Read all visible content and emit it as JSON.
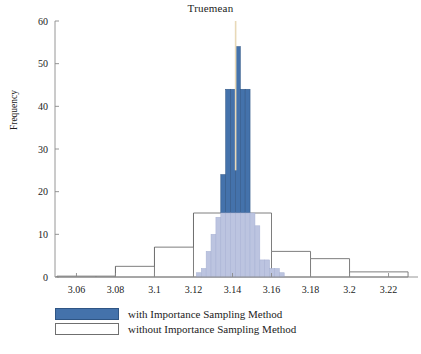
{
  "chart_data": {
    "type": "bar",
    "title": "Truemean",
    "xlabel": "",
    "ylabel": "Frequency",
    "xlim": [
      3.049,
      3.231
    ],
    "ylim": [
      0,
      60
    ],
    "grid": false,
    "legend_position": "bottom-left",
    "x_ticks": [
      "3.06",
      "3.08",
      "3.1",
      "3.12",
      "3.14",
      "3.16",
      "3.18",
      "3.2",
      "3.22"
    ],
    "x_tick_values": [
      3.06,
      3.08,
      3.1,
      3.12,
      3.14,
      3.16,
      3.18,
      3.2,
      3.22
    ],
    "y_ticks": [
      "0",
      "10",
      "20",
      "30",
      "40",
      "50",
      "60"
    ],
    "y_tick_values": [
      0,
      10,
      20,
      30,
      40,
      50,
      60
    ],
    "annotations": [
      {
        "name": "true-mean-marker",
        "type": "vline",
        "x": 3.1416,
        "color": "#e8d9b8",
        "y_from": 25,
        "y_to": 60
      }
    ],
    "series": [
      {
        "name": "with Importance Sampling Method",
        "style": "filled",
        "color": "#4472ab",
        "edge_color": "#2f5584",
        "bin_width": 0.0025,
        "bins": [
          {
            "x0": 3.1215,
            "x1": 3.124,
            "value": 1
          },
          {
            "x0": 3.124,
            "x1": 3.1265,
            "value": 2
          },
          {
            "x0": 3.1265,
            "x1": 3.129,
            "value": 6
          },
          {
            "x0": 3.129,
            "x1": 3.1315,
            "value": 10
          },
          {
            "x0": 3.1315,
            "x1": 3.134,
            "value": 14
          },
          {
            "x0": 3.134,
            "x1": 3.1365,
            "value": 24
          },
          {
            "x0": 3.1365,
            "x1": 3.139,
            "value": 44
          },
          {
            "x0": 3.139,
            "x1": 3.1415,
            "value": 44
          },
          {
            "x0": 3.1415,
            "x1": 3.144,
            "value": 54
          },
          {
            "x0": 3.144,
            "x1": 3.1465,
            "value": 44
          },
          {
            "x0": 3.1465,
            "x1": 3.149,
            "value": 44
          },
          {
            "x0": 3.149,
            "x1": 3.1515,
            "value": 15
          },
          {
            "x0": 3.1515,
            "x1": 3.154,
            "value": 12
          },
          {
            "x0": 3.154,
            "x1": 3.1565,
            "value": 4
          },
          {
            "x0": 3.1565,
            "x1": 3.159,
            "value": 4
          },
          {
            "x0": 3.159,
            "x1": 3.1615,
            "value": 2
          },
          {
            "x0": 3.1615,
            "x1": 3.164,
            "value": 2
          },
          {
            "x0": 3.164,
            "x1": 3.1665,
            "value": 1
          }
        ]
      },
      {
        "name": "without Importance Sampling Method",
        "style": "hollow",
        "color": "#ffffff",
        "edge_color": "#6f6f6f",
        "bin_width": 0.02,
        "bins": [
          {
            "x0": 3.05,
            "x1": 3.07,
            "value": 0.2
          },
          {
            "x0": 3.07,
            "x1": 3.08,
            "value": 0.2
          },
          {
            "x0": 3.08,
            "x1": 3.1,
            "value": 2.5
          },
          {
            "x0": 3.1,
            "x1": 3.12,
            "value": 7.0
          },
          {
            "x0": 3.12,
            "x1": 3.14,
            "value": 15.0
          },
          {
            "x0": 3.14,
            "x1": 3.16,
            "value": 15.0
          },
          {
            "x0": 3.16,
            "x1": 3.18,
            "value": 6.0
          },
          {
            "x0": 3.18,
            "x1": 3.2,
            "value": 4.3
          },
          {
            "x0": 3.2,
            "x1": 3.23,
            "value": 1.2
          }
        ]
      }
    ]
  },
  "legend": {
    "items": [
      {
        "label": "with Importance Sampling Method",
        "style": "filled"
      },
      {
        "label": "without Importance Sampling Method",
        "style": "hollow"
      }
    ]
  },
  "colors": {
    "series_filled": "#4472ab",
    "series_filled_edge": "#2f5584",
    "series_hollow_edge": "#6f6f6f",
    "overlap": "#bcc4e0",
    "axis": "#8a8a8a",
    "marker": "#e8d9b8",
    "text": "#1b1b1b",
    "background": "#ffffff"
  }
}
